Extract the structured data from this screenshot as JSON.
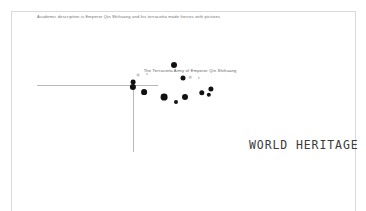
{
  "page": {
    "background_color": "#ffffff",
    "frame_color": "#d9d9d9",
    "width": 366,
    "height": 211
  },
  "caption": {
    "text": "Academic description is Emperor Qin Shihuang and his terracotta made horses with pictures",
    "color": "#6f6f6f"
  },
  "wordmark": {
    "text": "WORLD HERITAGE",
    "color": "#3b3b3b"
  },
  "chart_data": {
    "type": "scatter",
    "title": "The Terracotta Army of Emperor Qin Shihuang",
    "xlabel": "",
    "ylabel": "",
    "grid": false,
    "legend": "none",
    "axis_color": "#b9b9b9",
    "point_color": "#111111",
    "axes": {
      "x_axis": {
        "x1": 37,
        "y": 85,
        "x2": 158
      },
      "y_axis": {
        "x": 133,
        "y1": 85,
        "y2": 152
      }
    },
    "points": [
      {
        "x": 174,
        "y": 65,
        "r": 3.0,
        "shade": "dark"
      },
      {
        "x": 133,
        "y": 82,
        "r": 2.4,
        "shade": "dark"
      },
      {
        "x": 138,
        "y": 75,
        "r": 1.4,
        "shade": "faint"
      },
      {
        "x": 147,
        "y": 74,
        "r": 1.1,
        "shade": "faint"
      },
      {
        "x": 133,
        "y": 87,
        "r": 3.1,
        "shade": "dark"
      },
      {
        "x": 144,
        "y": 92,
        "r": 2.9,
        "shade": "dark"
      },
      {
        "x": 164,
        "y": 97,
        "r": 3.4,
        "shade": "dark"
      },
      {
        "x": 176,
        "y": 102,
        "r": 2.0,
        "shade": "dark"
      },
      {
        "x": 185,
        "y": 97,
        "r": 3.0,
        "shade": "dark"
      },
      {
        "x": 183,
        "y": 78,
        "r": 2.5,
        "shade": "dark"
      },
      {
        "x": 190,
        "y": 77,
        "r": 1.3,
        "shade": "faint"
      },
      {
        "x": 199,
        "y": 78,
        "r": 1.2,
        "shade": "faint"
      },
      {
        "x": 202,
        "y": 93,
        "r": 2.7,
        "shade": "dark"
      },
      {
        "x": 211,
        "y": 89,
        "r": 2.6,
        "shade": "dark"
      },
      {
        "x": 209,
        "y": 95,
        "r": 2.2,
        "shade": "dark"
      }
    ]
  }
}
